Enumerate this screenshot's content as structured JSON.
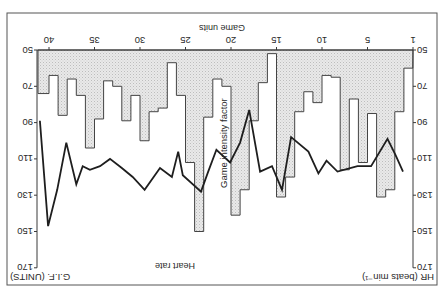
{
  "chart_data": {
    "type": "bar+line",
    "orientation_note": "figure displayed rotated 180 degrees",
    "title": "",
    "xlabel": "Game units",
    "ylabel_left": "HR (beats min⁻¹)",
    "ylabel_right": "G.I.F. (UNITS)",
    "x_ticks": [
      1,
      5,
      10,
      15,
      20,
      25,
      30,
      35,
      40
    ],
    "y_ticks": [
      50,
      70,
      90,
      110,
      130,
      150,
      170
    ],
    "ylim": [
      50,
      170
    ],
    "grid": false,
    "annotations": [
      "Game intensity factor",
      "Heart rate"
    ],
    "series": [
      {
        "name": "Game intensity factor",
        "kind": "step-bar",
        "units": [
          1,
          2,
          3,
          4,
          5,
          6,
          7,
          8,
          9,
          10,
          11,
          12,
          13,
          14,
          15,
          16,
          17,
          18,
          19,
          20,
          21,
          22,
          23,
          24,
          25,
          26,
          27,
          28,
          29,
          30,
          31,
          32,
          33,
          34,
          35,
          36,
          37,
          38,
          39,
          40,
          41
        ],
        "values": [
          60,
          84,
          127,
          131,
          85,
          112,
          77,
          116,
          65,
          64,
          79,
          73,
          84,
          120,
          131,
          52,
          68,
          89,
          127,
          141,
          70,
          66,
          87,
          150,
          112,
          75,
          57,
          82,
          84,
          100,
          75,
          89,
          70,
          67,
          88,
          104,
          75,
          66,
          86,
          64,
          74
        ]
      },
      {
        "name": "Heart rate",
        "kind": "line",
        "x": [
          1.3,
          2.1,
          3.0,
          4.8,
          6.3,
          8.5,
          9.7,
          10.6,
          11.7,
          13.6,
          14.6,
          15.7,
          17.0,
          18.2,
          19.2,
          20.3,
          21.8,
          22.7,
          23.5,
          25.5,
          26.0,
          26.7,
          28.0,
          29.7,
          31.0,
          32.2,
          33.5,
          34.6,
          35.7,
          36.5,
          37.2,
          38.3,
          39.3,
          40.3,
          41.2
        ],
        "y": [
          117,
          108,
          99,
          114,
          114,
          117,
          111,
          118,
          106,
          98,
          127,
          114,
          117,
          83,
          101,
          112,
          105,
          117,
          128,
          119,
          106,
          120,
          115,
          127,
          120,
          115,
          110,
          114,
          116,
          114,
          124,
          101,
          127,
          147,
          89
        ]
      }
    ]
  },
  "labels": {
    "x_axis_title": "Game units",
    "left_axis_title": "HR (beats min⁻¹)",
    "right_axis_title": "G.I.F. (UNITS)",
    "gif_annotation": "Game intensity factor",
    "hr_annotation": "Heart rate"
  }
}
